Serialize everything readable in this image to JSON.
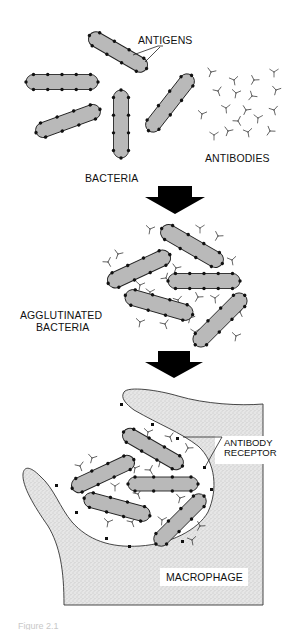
{
  "figure": {
    "labels": {
      "antigens": "ANTIGENS",
      "antibodies": "ANTIBODIES",
      "bacteria": "BACTERIA",
      "agglutinated_line1": "AGGLUTINATED",
      "agglutinated_line2": "BACTERIA",
      "antibody_receptor_line1": "ANTIBODY",
      "antibody_receptor_line2": "RECEPTOR",
      "macrophage": "MACROPHAGE"
    },
    "caption": "Figure 2.1",
    "colors": {
      "bacterium_fill": "#b9b9b9",
      "outline": "#222222",
      "antigen_dot": "#111111",
      "arrow": "#000000",
      "macrophage_stipple_bg": "#e6e6e6",
      "macrophage_stipple_dot": "#9a9a9a"
    },
    "stages": [
      {
        "name": "free bacteria and antibodies",
        "bacteria": [
          {
            "cx": 118,
            "cy": 52,
            "len": 66,
            "w": 15,
            "angle": 30
          },
          {
            "cx": 62,
            "cy": 82,
            "len": 72,
            "w": 15,
            "angle": 0
          },
          {
            "cx": 68,
            "cy": 121,
            "len": 68,
            "w": 15,
            "angle": -20
          },
          {
            "cx": 121,
            "cy": 124,
            "len": 68,
            "w": 15,
            "angle": 90
          },
          {
            "cx": 170,
            "cy": 103,
            "len": 70,
            "w": 15,
            "angle": -52
          }
        ],
        "antibodies": [
          [
            211,
            72,
            20
          ],
          [
            234,
            80,
            -10
          ],
          [
            254,
            80,
            30
          ],
          [
            274,
            72,
            0
          ],
          [
            218,
            91,
            -20
          ],
          [
            236,
            93,
            10
          ],
          [
            252,
            96,
            40
          ],
          [
            276,
            90,
            15
          ],
          [
            226,
            108,
            -5
          ],
          [
            246,
            110,
            25
          ],
          [
            202,
            114,
            10
          ],
          [
            238,
            121,
            -30
          ],
          [
            258,
            118,
            5
          ],
          [
            274,
            110,
            -15
          ],
          [
            228,
            131,
            20
          ],
          [
            248,
            132,
            -10
          ],
          [
            270,
            131,
            35
          ],
          [
            214,
            135,
            0
          ]
        ]
      },
      {
        "name": "agglutinated bacteria",
        "bacteria": [
          {
            "cx": 192,
            "cy": 246,
            "len": 70,
            "w": 16,
            "angle": 30
          },
          {
            "cx": 139,
            "cy": 269,
            "len": 68,
            "w": 16,
            "angle": -25
          },
          {
            "cx": 204,
            "cy": 281,
            "len": 72,
            "w": 15,
            "angle": 0
          },
          {
            "cx": 159,
            "cy": 305,
            "len": 70,
            "w": 16,
            "angle": 16
          },
          {
            "cx": 220,
            "cy": 320,
            "len": 70,
            "w": 16,
            "angle": -45
          }
        ]
      },
      {
        "name": "phagocytosis by macrophage",
        "bacteria": [
          {
            "cx": 153,
            "cy": 449,
            "len": 68,
            "w": 15,
            "angle": 30
          },
          {
            "cx": 103,
            "cy": 474,
            "len": 68,
            "w": 15,
            "angle": -25
          },
          {
            "cx": 163,
            "cy": 484,
            "len": 70,
            "w": 14,
            "angle": 0
          },
          {
            "cx": 117,
            "cy": 507,
            "len": 68,
            "w": 15,
            "angle": 15
          },
          {
            "cx": 180,
            "cy": 520,
            "len": 68,
            "w": 15,
            "angle": -45
          }
        ]
      }
    ],
    "arrows": [
      {
        "cx": 175,
        "shaft_top": 186,
        "head_top": 197,
        "tip": 214,
        "shaft_half": 17,
        "head_half": 30
      },
      {
        "cx": 174,
        "shaft_top": 351,
        "head_top": 362,
        "tip": 378,
        "shaft_half": 16,
        "head_half": 29
      }
    ]
  }
}
